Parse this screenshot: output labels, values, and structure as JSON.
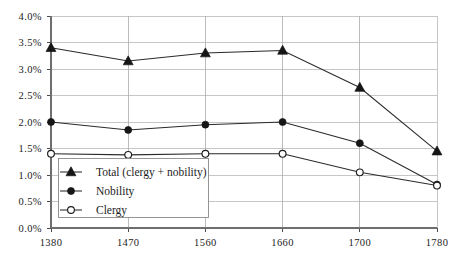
{
  "chart_data": {
    "type": "line",
    "title": "",
    "subtitle": "",
    "xlabel": "",
    "ylabel": "",
    "categories": [
      "1380",
      "1470",
      "1560",
      "1660",
      "1700",
      "1780"
    ],
    "x_tick_labels": [
      "1380",
      "1470",
      "1560",
      "1660",
      "1700",
      "1780"
    ],
    "y_tick_labels": [
      "0.0%",
      "0.5%",
      "1.0%",
      "1.5%",
      "2.0%",
      "2.5%",
      "3.0%",
      "3.5%",
      "4.0%"
    ],
    "y_tick_values": [
      0.0,
      0.5,
      1.0,
      1.5,
      2.0,
      2.5,
      3.0,
      3.5,
      4.0
    ],
    "ylim": [
      0.0,
      4.0
    ],
    "y_unit": "%",
    "grid": true,
    "grid_axes": "both",
    "legend_position": "inside-lower-left",
    "series": [
      {
        "name": "Total (clergy + nobility)",
        "marker": "triangle-filled",
        "values": [
          3.4,
          3.15,
          3.3,
          3.35,
          2.65,
          1.45
        ]
      },
      {
        "name": "Nobility",
        "marker": "circle-filled",
        "values": [
          2.0,
          1.85,
          1.95,
          2.0,
          1.6,
          0.82
        ]
      },
      {
        "name": "Clergy",
        "marker": "circle-open",
        "values": [
          1.4,
          1.38,
          1.4,
          1.4,
          1.05,
          0.8
        ]
      }
    ],
    "legend_entries": [
      {
        "label": "Total (clergy + nobility)",
        "marker": "triangle-filled"
      },
      {
        "label": "Nobility",
        "marker": "circle-filled"
      },
      {
        "label": "Clergy",
        "marker": "circle-open"
      }
    ],
    "colors": {
      "line": "#2a2a2a",
      "marker_fill": "#161616",
      "marker_open_fill": "#ffffff",
      "gridline": "#b8b8b8",
      "axis": "#6e6e6e",
      "text": "#1d1d1d",
      "background": "#ffffff"
    }
  }
}
